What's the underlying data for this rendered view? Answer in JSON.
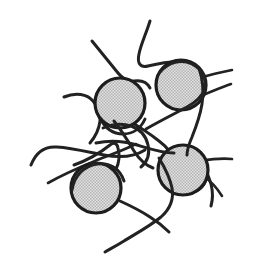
{
  "figure": {
    "background_color": "#ffffff",
    "width": 257,
    "height": 269
  },
  "style": {
    "particle_fill_color": "#d4d4d4",
    "particle_halftone_color": "#9c9c9c",
    "particle_outline_color": "#1d1d1d",
    "particle_outline_width": 3.2,
    "chain_color": "#222222",
    "chain_width_thick": 3.0,
    "chain_width_thin": 2.2
  },
  "nanoparticles": [
    {
      "name": "nanoparticle-upper-left",
      "cx": 120,
      "cy": 103,
      "r": 25
    },
    {
      "name": "nanoparticle-upper-right",
      "cx": 181,
      "cy": 85,
      "r": 25
    },
    {
      "name": "nanoparticle-lower-left",
      "cx": 96,
      "cy": 188,
      "r": 25
    },
    {
      "name": "nanoparticle-lower-right",
      "cx": 183,
      "cy": 170,
      "r": 25
    }
  ],
  "chains": [
    {
      "name": "chain-top-arch",
      "width": 3.0,
      "d": "M 150 21 C 146 34, 141 44, 139 54 C 137 63, 140 68, 148 66 C 160 63, 174 61, 185 62 C 192 63, 194 66, 193 70"
    },
    {
      "name": "chain-upper-left-diagonal",
      "width": 3.0,
      "d": "M 92 41 C 101 52, 110 63, 118 73 C 123 79, 128 82, 134 81 C 141 80, 147 82, 150 88"
    },
    {
      "name": "chain-left-wave",
      "width": 3.0,
      "d": "M 64 97 C 76 92, 87 94, 93 101 C 98 107, 101 113, 100 121 C 99 130, 95 137, 90 143"
    },
    {
      "name": "chain-left-sweep",
      "width": 3.0,
      "d": "M 31 165 C 36 152, 45 146, 57 147 C 72 148, 88 152, 104 155 C 120 158, 134 157, 145 150"
    },
    {
      "name": "chain-left-lower-tail",
      "width": 2.6,
      "d": "M 48 183 C 62 175, 78 168, 95 161 C 110 155, 124 150, 136 144"
    },
    {
      "name": "chain-triangle-left",
      "width": 3.0,
      "d": "M 74 165 C 88 160, 100 153, 110 145 C 114 142, 117 143, 118 148 C 120 156, 119 163, 116 169"
    },
    {
      "name": "chain-center-loop-a",
      "width": 3.0,
      "d": "M 103 128 C 112 124, 122 123, 131 126 C 140 129, 146 136, 148 145 C 150 154, 147 162, 141 167"
    },
    {
      "name": "chain-center-loop-b",
      "width": 3.0,
      "d": "M 114 121 C 122 131, 128 141, 134 151 C 139 159, 145 165, 153 168"
    },
    {
      "name": "chain-center-cross",
      "width": 3.0,
      "d": "M 96 143 C 110 140, 124 141, 137 145 C 150 149, 162 153, 174 153"
    },
    {
      "name": "chain-center-to-lower-right",
      "width": 3.0,
      "d": "M 126 119 C 138 126, 149 133, 159 141 C 167 147, 172 153, 173 160"
    },
    {
      "name": "chain-midright-diagonal",
      "width": 3.0,
      "d": "M 146 129 C 160 121, 174 114, 187 107 C 196 102, 202 96, 205 89"
    },
    {
      "name": "chain-right-upper-branch",
      "width": 2.6,
      "d": "M 203 77 C 212 74, 222 72, 232 70"
    },
    {
      "name": "chain-right-mid-branch",
      "width": 2.6,
      "d": "M 203 95 C 213 91, 222 87, 231 84"
    },
    {
      "name": "chain-right-vertical",
      "width": 3.0,
      "d": "M 199 68 C 203 80, 204 92, 202 104 C 200 116, 196 127, 192 137 C 189 144, 187 149, 187 155"
    },
    {
      "name": "chain-lower-right-fan-a",
      "width": 2.6,
      "d": "M 201 161 C 212 159, 222 158, 232 159"
    },
    {
      "name": "chain-lower-right-fan-b",
      "width": 2.6,
      "d": "M 203 176 C 211 181, 217 188, 222 196"
    },
    {
      "name": "chain-lower-right-tail",
      "width": 3.0,
      "d": "M 196 155 C 203 164, 208 174, 211 184 C 213 192, 213 199, 211 206"
    },
    {
      "name": "chain-bottom-long-tail",
      "width": 3.0,
      "d": "M 159 158 C 165 168, 170 178, 172 188 C 174 199, 170 209, 161 217 C 150 226, 137 233, 124 241 C 116 246, 110 249, 105 252"
    },
    {
      "name": "chain-bottom-left-tail",
      "width": 3.0,
      "d": "M 120 201 C 131 206, 141 211, 150 217 C 158 222, 164 227, 169 232"
    },
    {
      "name": "chain-particle4-under",
      "width": 3.0,
      "d": "M 160 175 C 166 186, 175 193, 186 193 C 196 193, 203 188, 206 180"
    },
    {
      "name": "chain-particle1-under",
      "width": 3.0,
      "d": "M 100 118 C 105 128, 113 134, 123 134 C 133 134, 141 128, 145 119"
    },
    {
      "name": "chain-particle3-over",
      "width": 3.0,
      "d": "M 72 190 C 74 176, 84 166, 97 164 C 110 162, 120 169, 124 181"
    },
    {
      "name": "chain-particle2-over",
      "width": 3.0,
      "d": "M 160 72 C 169 62, 181 59, 192 64 C 202 69, 207 79, 205 90"
    }
  ]
}
